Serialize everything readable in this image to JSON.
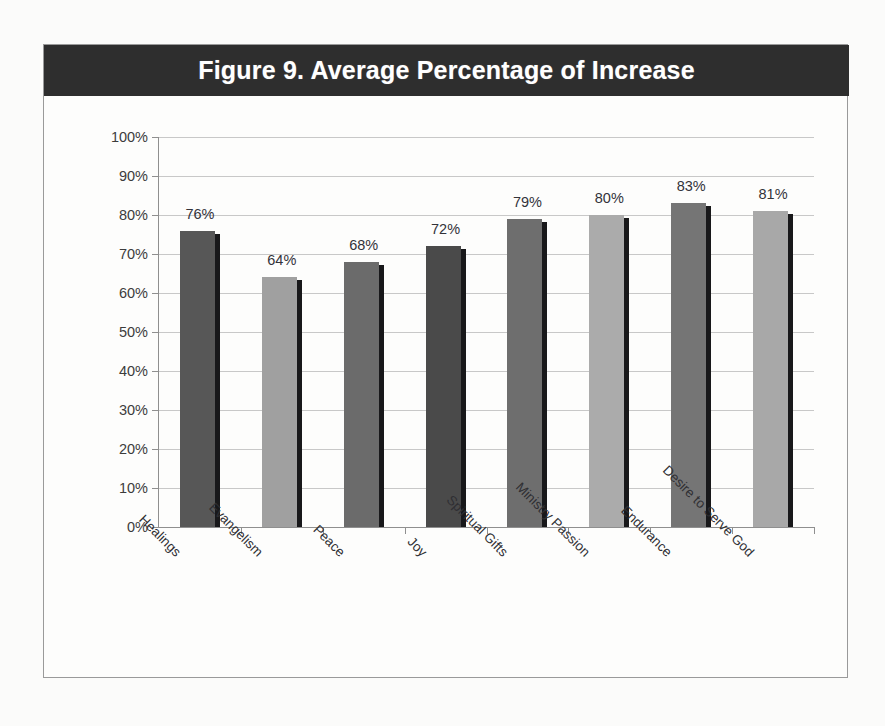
{
  "figure": {
    "title": "Figure 9. Average Percentage of Increase",
    "banner_color": "#2e2e2e",
    "banner_text_color": "#ffffff",
    "frame_color": "#9a9a9a",
    "page_background": "#fbfbfa"
  },
  "chart_data": {
    "type": "bar",
    "title": "Figure 9. Average Percentage of Increase",
    "xlabel": "",
    "ylabel": "",
    "ylim": [
      0,
      100
    ],
    "y_ticks": [
      "0%",
      "10%",
      "20%",
      "30%",
      "40%",
      "50%",
      "60%",
      "70%",
      "80%",
      "90%",
      "100%"
    ],
    "grid": true,
    "legend": "none",
    "categories": [
      "Healings",
      "Evangelism",
      "Peace",
      "Joy",
      "Spiritual Gifts",
      "Ministry Passion",
      "Endurance",
      "Desire to Serve God"
    ],
    "values": [
      76,
      64,
      68,
      72,
      79,
      80,
      83,
      81
    ],
    "data_labels": [
      "76%",
      "64%",
      "68%",
      "72%",
      "79%",
      "80%",
      "83%",
      "81%"
    ],
    "bar_colors": [
      "#575757",
      "#a0a0a0",
      "#6b6b6b",
      "#4a4a4a",
      "#6e6e6e",
      "#ababab",
      "#757575",
      "#a8a8a8"
    ],
    "bar_shadow_color": "#18181a",
    "gridline_color": "#c8c8c8",
    "axis_color": "#8f8f8f"
  }
}
